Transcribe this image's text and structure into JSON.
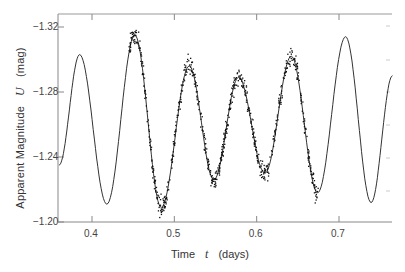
{
  "chart_data": {
    "type": "scatter",
    "title": "",
    "xlabel": "Time t (days)",
    "ylabel": "Apparent Magnitude U (mag)",
    "xlabel_parts": {
      "name": "Time",
      "symbol": "t",
      "unit": "(days)"
    },
    "ylabel_parts": {
      "name": "Apparent Magnitude",
      "symbol": "U",
      "unit": "(mag)"
    },
    "xlim": [
      0.36,
      0.765
    ],
    "ylim": [
      -1.2,
      -1.327
    ],
    "y_inverted": true,
    "x_ticks": [
      0.4,
      0.5,
      0.6,
      0.7
    ],
    "x_tick_labels": [
      "0.4",
      "0.5",
      "0.6",
      "0.7"
    ],
    "y_ticks": [
      -1.32,
      -1.28,
      -1.24,
      -1.2
    ],
    "y_tick_labels": [
      "-1.32",
      "-1.28",
      "-1.24",
      "-1.20"
    ],
    "grid": false,
    "legend": null,
    "series": [
      {
        "name": "model curve (solid line)",
        "kind": "line",
        "x": [
          0.36,
          0.385,
          0.418,
          0.452,
          0.484,
          0.518,
          0.548,
          0.578,
          0.61,
          0.642,
          0.674,
          0.708,
          0.739,
          0.765
        ],
        "y": [
          -1.235,
          -1.303,
          -1.211,
          -1.315,
          -1.209,
          -1.296,
          -1.226,
          -1.289,
          -1.23,
          -1.302,
          -1.218,
          -1.314,
          -1.212,
          -1.29
        ]
      },
      {
        "name": "observations (dots)",
        "kind": "scatter",
        "x_range": [
          0.445,
          0.675
        ],
        "peaks": [
          {
            "x": 0.452,
            "y": -1.315
          },
          {
            "x": 0.518,
            "y": -1.296
          },
          {
            "x": 0.578,
            "y": -1.289
          },
          {
            "x": 0.642,
            "y": -1.302
          }
        ],
        "troughs": [
          {
            "x": 0.484,
            "y": -1.209
          },
          {
            "x": 0.548,
            "y": -1.226
          },
          {
            "x": 0.61,
            "y": -1.23
          },
          {
            "x": 0.674,
            "y": -1.218
          }
        ]
      }
    ]
  },
  "labels": {
    "x_name": "Time",
    "x_symbol": "t",
    "x_unit": "(days)",
    "y_name": "Apparent Magnitude",
    "y_symbol": "U",
    "y_unit": "(mag)"
  },
  "ticks": {
    "x": [
      "0.4",
      "0.5",
      "0.6",
      "0.7"
    ],
    "y": [
      "−1.32",
      "−1.28",
      "−1.24",
      "−1.20"
    ]
  }
}
